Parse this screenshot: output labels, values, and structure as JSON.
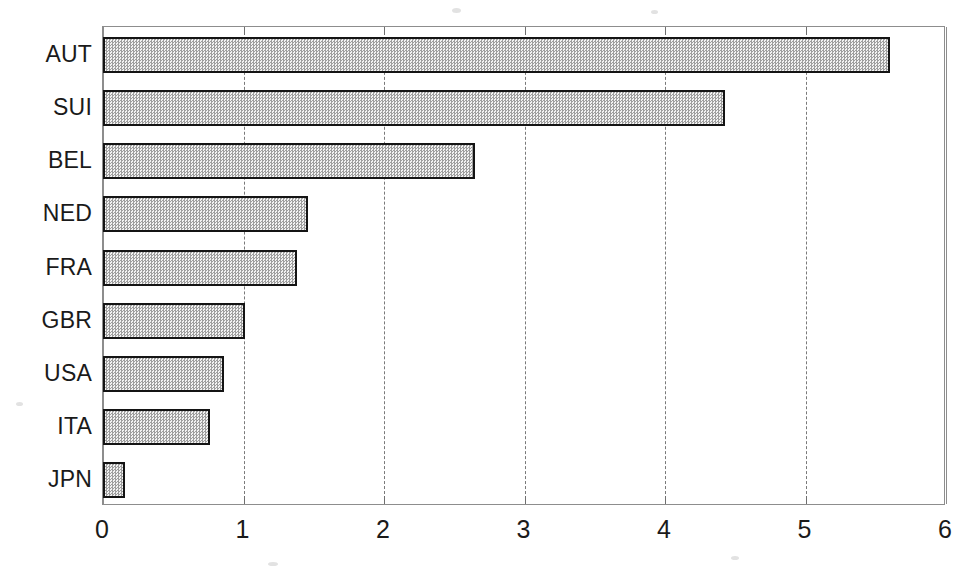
{
  "chart_data": {
    "type": "bar",
    "orientation": "horizontal",
    "title": "",
    "subtitle": "",
    "xlabel": "",
    "ylabel": "",
    "categories": [
      "AUT",
      "SUI",
      "BEL",
      "NED",
      "FRA",
      "GBR",
      "USA",
      "ITA",
      "JPN"
    ],
    "values": [
      5.6,
      4.43,
      2.65,
      1.46,
      1.38,
      1.01,
      0.86,
      0.76,
      0.16
    ],
    "series": [
      {
        "name": "value",
        "values": [
          5.6,
          4.43,
          2.65,
          1.46,
          1.38,
          1.01,
          0.86,
          0.76,
          0.16
        ]
      }
    ],
    "xlim": [
      0,
      6
    ],
    "ylim": null,
    "x_ticks": [
      0,
      1,
      2,
      3,
      4,
      5,
      6
    ],
    "x_tick_labels": [
      "0",
      "1",
      "2",
      "3",
      "4",
      "5",
      "6"
    ],
    "y_tick_labels": [
      "AUT",
      "SUI",
      "BEL",
      "NED",
      "FRA",
      "GBR",
      "USA",
      "ITA",
      "JPN"
    ],
    "grid": true,
    "grid_axis": "x",
    "grid_style": "dashed",
    "legend": false,
    "legend_position": "none",
    "annotations": [],
    "bar_fill": "#a0a0a0",
    "bar_fill_pattern": "checkerboard-dither",
    "bar_edge_color": "#141414",
    "axis_color": "#8d8d8d",
    "grid_color": "#7a7a7a",
    "background": "#ffffff"
  },
  "axis": {
    "x_tick_labels": [
      "0",
      "1",
      "2",
      "3",
      "4",
      "5",
      "6"
    ],
    "y_tick_labels": [
      "AUT",
      "SUI",
      "BEL",
      "NED",
      "FRA",
      "GBR",
      "USA",
      "ITA",
      "JPN"
    ]
  }
}
